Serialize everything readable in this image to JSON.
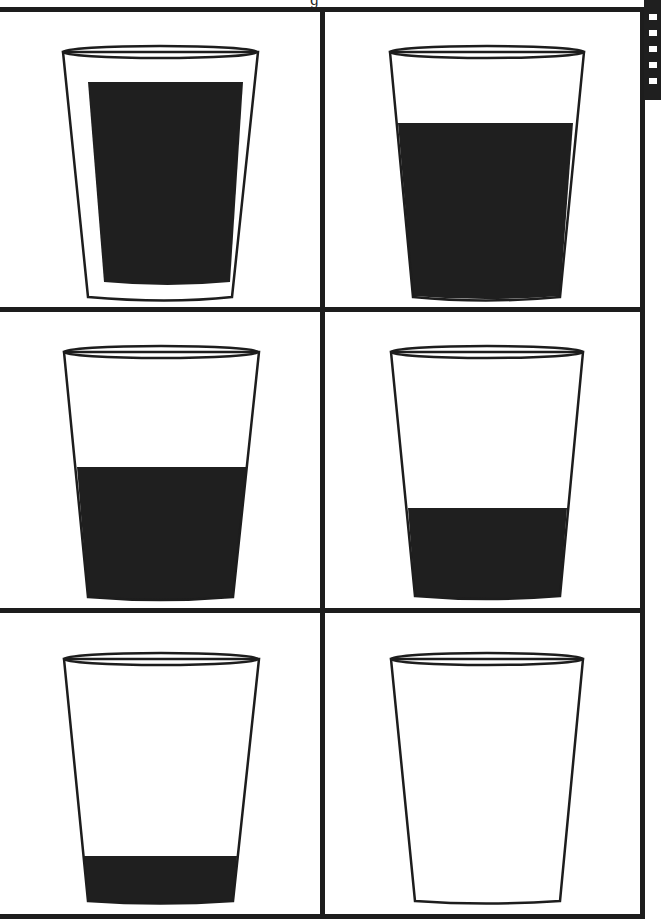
{
  "page": {
    "title_fragment": "g"
  },
  "colors": {
    "line": "#1d1d1d",
    "liquid": "#1f1f1f",
    "background": "#ffffff"
  },
  "glasses": [
    {
      "position": "row1-col1",
      "fill_label": "nearly full",
      "fill_fraction": 0.84
    },
    {
      "position": "row1-col2",
      "fill_label": "about two-thirds",
      "fill_fraction": 0.68
    },
    {
      "position": "row2-col1",
      "fill_label": "about half",
      "fill_fraction": 0.52
    },
    {
      "position": "row2-col2",
      "fill_label": "about one-third",
      "fill_fraction": 0.34
    },
    {
      "position": "row3-col1",
      "fill_label": "nearly empty",
      "fill_fraction": 0.18
    },
    {
      "position": "row3-col2",
      "fill_label": "empty",
      "fill_fraction": 0.0
    }
  ]
}
